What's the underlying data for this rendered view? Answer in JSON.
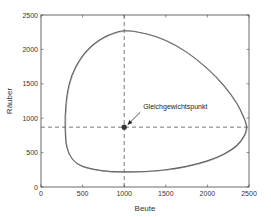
{
  "chart_data": {
    "type": "line",
    "title": "",
    "xlabel": "Beute",
    "ylabel": "Räuber",
    "xlim": [
      0,
      2500
    ],
    "ylim": [
      0,
      2500
    ],
    "xticks": [
      0,
      500,
      1000,
      1500,
      2000,
      2500
    ],
    "yticks": [
      0,
      500,
      1000,
      1500,
      2000,
      2500
    ],
    "xtick_labels": [
      "0",
      "500",
      "1000",
      "1500",
      "2000",
      "2500"
    ],
    "ytick_labels": [
      "0",
      "500",
      "1000",
      "1500",
      "2000",
      "2500"
    ],
    "grid": false,
    "legend": null,
    "series": [
      {
        "name": "Phasenbahn",
        "color": "#555555",
        "closed": true,
        "x": [
          1000,
          1250,
          1500,
          1750,
          2000,
          2200,
          2350,
          2440,
          2470,
          2440,
          2350,
          2200,
          2000,
          1750,
          1500,
          1250,
          1000,
          750,
          500,
          380,
          310,
          290,
          300,
          340,
          420,
          550,
          750,
          1000
        ],
        "y": [
          2270,
          2230,
          2130,
          1960,
          1720,
          1470,
          1220,
          1000,
          870,
          740,
          600,
          480,
          380,
          300,
          250,
          225,
          220,
          235,
          300,
          400,
          580,
          870,
          1200,
          1500,
          1750,
          1980,
          2170,
          2270
        ]
      }
    ],
    "reference_lines": [
      {
        "orientation": "vertical",
        "x": 1000,
        "style": "dashed",
        "color": "#555555"
      },
      {
        "orientation": "horizontal",
        "y": 870,
        "style": "dashed",
        "color": "#555555"
      }
    ],
    "points": [
      {
        "label": "Gleichgewichtspunkt",
        "x": 1000,
        "y": 870,
        "marker": "filled-circle",
        "color": "#333333"
      }
    ],
    "annotations": [
      {
        "text": "Gleichgewichtspunkt",
        "x": 1180,
        "y": 1100,
        "arrow_to": [
          1000,
          870
        ]
      }
    ]
  },
  "plot": {
    "left": 41,
    "right": 249,
    "top": 15,
    "bottom": 187
  }
}
